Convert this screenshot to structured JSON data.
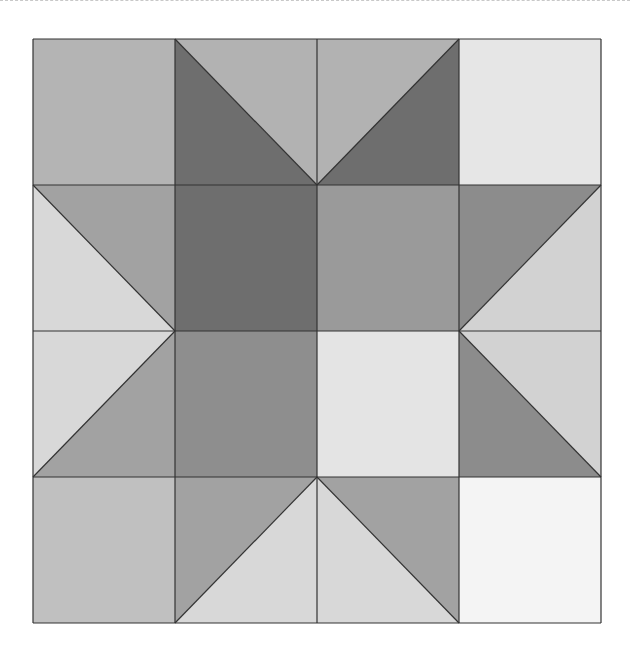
{
  "diagram": {
    "title": "",
    "type": "quilt-block-star",
    "grid": {
      "rows": 4,
      "cols": 4,
      "x_edges": [
        33,
        175,
        317,
        459,
        601
      ],
      "y_edges": [
        39,
        185,
        331,
        477,
        623
      ],
      "stroke": "#333333",
      "stroke_width": 1.2
    },
    "colors": {
      "dark": "#6e6e6e",
      "mid_dark": "#8e8e8e",
      "mid": "#9c9c9c",
      "mid_light": "#b2b2b2",
      "light_gray": "#c0c0c0",
      "light": "#d8d8d8",
      "very_light": "#e6e6e6",
      "near_white": "#f4f4f4"
    },
    "cells": [
      {
        "row": 0,
        "col": 0,
        "kind": "solid",
        "fill": "#b4b4b4"
      },
      {
        "row": 0,
        "col": 1,
        "kind": "diag-tl-br",
        "lower_left": "#6e6e6e",
        "upper_right": "#b2b2b2"
      },
      {
        "row": 0,
        "col": 2,
        "kind": "diag-tr-bl",
        "upper_left": "#b2b2b2",
        "lower_right": "#6e6e6e"
      },
      {
        "row": 0,
        "col": 3,
        "kind": "solid",
        "fill": "#e6e6e6"
      },
      {
        "row": 1,
        "col": 0,
        "kind": "diag-tl-br",
        "lower_left": "#d8d8d8",
        "upper_right": "#a2a2a2"
      },
      {
        "row": 1,
        "col": 1,
        "kind": "solid",
        "fill": "#6e6e6e"
      },
      {
        "row": 1,
        "col": 2,
        "kind": "solid",
        "fill": "#9a9a9a"
      },
      {
        "row": 1,
        "col": 3,
        "kind": "diag-tr-bl",
        "upper_left": "#8c8c8c",
        "lower_right": "#d2d2d2"
      },
      {
        "row": 2,
        "col": 0,
        "kind": "diag-tr-bl",
        "upper_left": "#d8d8d8",
        "lower_right": "#a2a2a2"
      },
      {
        "row": 2,
        "col": 1,
        "kind": "solid",
        "fill": "#8e8e8e"
      },
      {
        "row": 2,
        "col": 2,
        "kind": "solid",
        "fill": "#e4e4e4"
      },
      {
        "row": 2,
        "col": 3,
        "kind": "diag-tl-br",
        "lower_left": "#8c8c8c",
        "upper_right": "#d2d2d2"
      },
      {
        "row": 3,
        "col": 0,
        "kind": "solid",
        "fill": "#c0c0c0"
      },
      {
        "row": 3,
        "col": 1,
        "kind": "diag-tr-bl",
        "upper_left": "#a2a2a2",
        "lower_right": "#d8d8d8"
      },
      {
        "row": 3,
        "col": 2,
        "kind": "diag-tl-br",
        "lower_left": "#d8d8d8",
        "upper_right": "#a2a2a2"
      },
      {
        "row": 3,
        "col": 3,
        "kind": "solid",
        "fill": "#f4f4f4"
      }
    ]
  }
}
